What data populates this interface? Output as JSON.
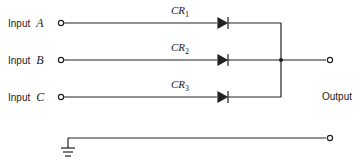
{
  "diagram": {
    "type": "diode OR gate circuit",
    "inputs": [
      {
        "label": "Input",
        "letter": "A",
        "diode": "CR",
        "diode_sub": "1"
      },
      {
        "label": "Input",
        "letter": "B",
        "diode": "CR",
        "diode_sub": "2"
      },
      {
        "label": "Input",
        "letter": "C",
        "diode": "CR",
        "diode_sub": "3"
      }
    ],
    "output_label": "Output",
    "ground_symbol": "ground-icon",
    "line_color": "#222222"
  }
}
